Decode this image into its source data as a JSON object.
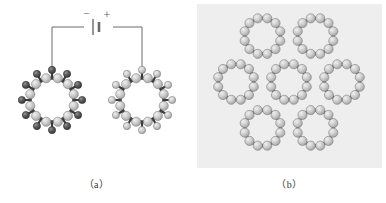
{
  "figure": {
    "width": 386,
    "height": 203,
    "background_color": "#ffffff",
    "panel_b_background_color": "#eeeeee"
  },
  "panels": [
    {
      "id": "a",
      "caption": "（a）",
      "background_color": "#ffffff",
      "description": "Two nanotube cross-section rings connected by a circuit to a battery",
      "circuit": {
        "battery": {
          "minus_label": "−",
          "plus_label": "+",
          "line_color": "#6b6b6b"
        },
        "wire_color": "#6b6b6b"
      },
      "rings": [
        {
          "id": "left-ring",
          "cx": 52,
          "cy": 100,
          "inner_radius": 22.5,
          "outer_radius": 31,
          "atom_count": 12,
          "inner_atom_color": "#c9c9c9",
          "outer_atom_color": "#555555",
          "has_outer_shell": true
        },
        {
          "id": "right-ring",
          "cx": 142,
          "cy": 100,
          "inner_radius": 22.5,
          "outer_radius": 31,
          "atom_count": 12,
          "inner_atom_color": "#c9c9c9",
          "outer_atom_color": "#c9c9c9",
          "has_outer_shell": true
        }
      ]
    },
    {
      "id": "b",
      "caption": "（b）",
      "background_color": "#eeeeee",
      "description": "Bundle of seven nanotube cross-section rings packed in a hexagonal array",
      "ring_count": 7,
      "center_ring": {
        "cx": 96,
        "cy": 82
      },
      "ring_radius": 26,
      "lattice_spacing": 53,
      "inner_atom_color": "#c9c9c9",
      "outer_atom_color": "#555555"
    }
  ],
  "colors": {
    "atom_light": "#c9c9c9",
    "atom_light_edge": "#7f7f7f",
    "atom_dark": "#555555",
    "atom_dark_edge": "#2f2f2f",
    "bond": "#3b3b3b",
    "panel_gray": "#eeeeee",
    "wire": "#6b6b6b",
    "caption_text": "#3a3a3a"
  }
}
